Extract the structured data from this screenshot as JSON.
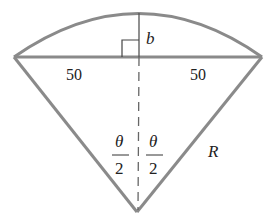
{
  "diagram": {
    "labels": {
      "sagitta": "b",
      "half_chord_left": "50",
      "half_chord_right": "50",
      "theta_left_num": "θ",
      "theta_left_den": "2",
      "theta_right_num": "θ",
      "theta_right_den": "2",
      "radius": "R"
    },
    "colors": {
      "stroke": "#8a8a8a",
      "text": "#222222"
    }
  }
}
